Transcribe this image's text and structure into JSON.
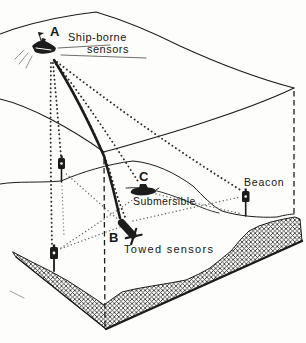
{
  "figure": {
    "labels": {
      "point_a": "A",
      "point_b": "B",
      "point_c": "C",
      "ship_sensors_line1": "Ship-borne",
      "ship_sensors_line2": "sensors",
      "submersible": "Submersible",
      "towed_sensors": "Towed sensors",
      "beacon": "Beacon"
    },
    "colors": {
      "ink": "#1c1c1c",
      "paper": "#fdfdfb",
      "ray_primary": "#2a2a2a",
      "ray_secondary": "#6e6e6e"
    },
    "icons": {
      "ship-icon": "black surface vessel silhouette at point A",
      "towed-sensor-icon": "black towed sensor body with tail fins at point B",
      "submersible-icon": "black small submarine silhouette at point C",
      "beacon-icon": "seafloor transponder beacon on a short pole (x3)"
    }
  }
}
